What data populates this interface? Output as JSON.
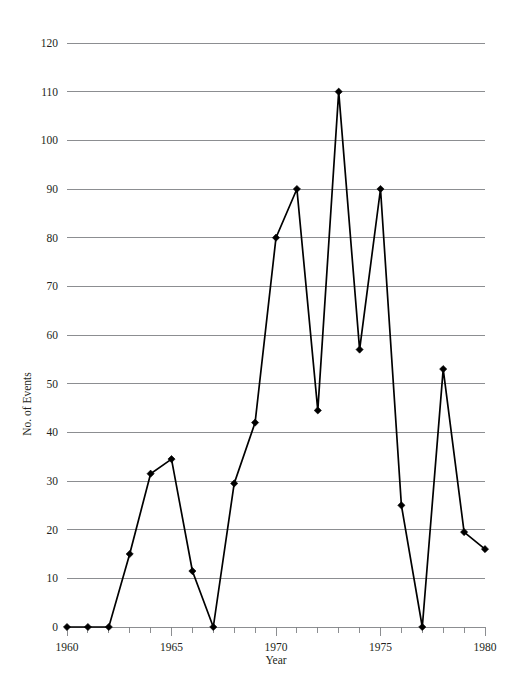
{
  "chart_data": {
    "type": "line",
    "title": "",
    "xlabel": "Year",
    "ylabel": "No. of Events",
    "xlim": [
      1960,
      1980
    ],
    "ylim": [
      0,
      120
    ],
    "grid": true,
    "legend": "none",
    "marker": "diamond",
    "line_color": "#000000",
    "grid_color": "#808285",
    "x": [
      1960,
      1961,
      1962,
      1963,
      1964,
      1965,
      1966,
      1967,
      1968,
      1969,
      1970,
      1971,
      1972,
      1973,
      1974,
      1975,
      1976,
      1977,
      1978,
      1979,
      1980
    ],
    "values": [
      0,
      0,
      0,
      15,
      31.5,
      34.5,
      11.5,
      0,
      29.5,
      42,
      80,
      90,
      44.5,
      110,
      57,
      90,
      25,
      0,
      53,
      19.5,
      16
    ],
    "xticks": [
      1960,
      1961,
      1962,
      1963,
      1964,
      1965,
      1966,
      1967,
      1968,
      1969,
      1970,
      1971,
      1972,
      1973,
      1974,
      1975,
      1976,
      1977,
      1978,
      1979,
      1980
    ],
    "xticklabels": [
      "1960",
      "",
      "",
      "",
      "",
      "1965",
      "",
      "",
      "",
      "",
      "1970",
      "",
      "",
      "",
      "",
      "1975",
      "",
      "",
      "",
      "",
      "1980"
    ],
    "yticks": [
      0,
      10,
      20,
      30,
      40,
      50,
      60,
      70,
      80,
      90,
      100,
      110,
      120
    ],
    "yticklabels": [
      "0",
      "10",
      "20",
      "30",
      "40",
      "50",
      "60",
      "70",
      "80",
      "90",
      "100",
      "110",
      "120"
    ]
  },
  "axis": {
    "x_title": "Year",
    "y_title": "No. of Events"
  }
}
